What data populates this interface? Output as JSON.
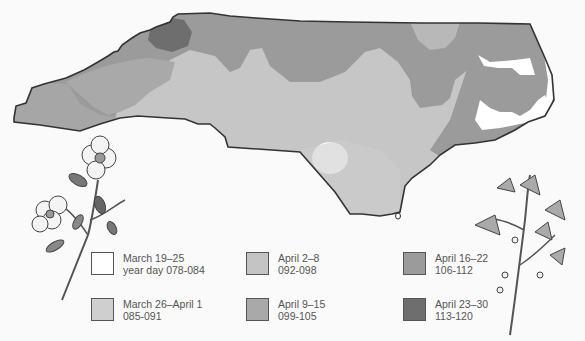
{
  "map": {
    "region": "North Carolina",
    "colors": {
      "c1": "#ffffff",
      "c2": "#cfcfcf",
      "c3": "#c2c2c2",
      "c4": "#a8a8a8",
      "c5": "#9a9a9a",
      "c6": "#6f6f6f",
      "outline": "#333333"
    },
    "illustrations": [
      "dogwood-branch",
      "redbud-branch"
    ]
  },
  "legend": {
    "items": [
      {
        "dates": "March 19–25",
        "days": "year day 078-084",
        "color": "#ffffff"
      },
      {
        "dates": "March 26–April 1",
        "days": "085-091",
        "color": "#cfcfcf"
      },
      {
        "dates": "April 2–8",
        "days": "092-098",
        "color": "#c4c4c4"
      },
      {
        "dates": "April 9–15",
        "days": "099-105",
        "color": "#a9a9a9"
      },
      {
        "dates": "April 16–22",
        "days": "106-112",
        "color": "#9b9b9b"
      },
      {
        "dates": "April 23–30",
        "days": "113-120",
        "color": "#6e6e6e"
      }
    ]
  }
}
